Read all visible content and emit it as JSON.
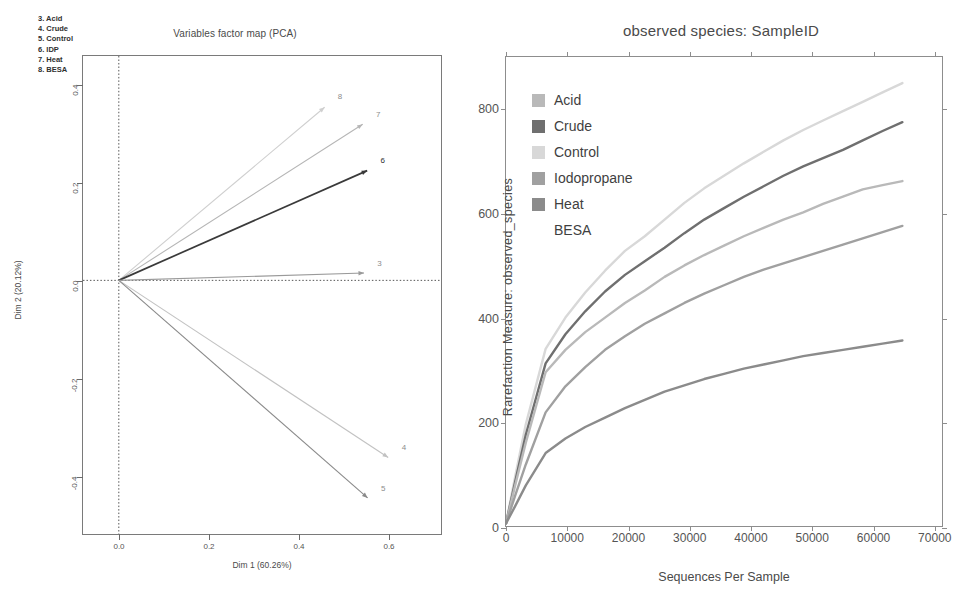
{
  "pca": {
    "title": "Variables factor map (PCA)",
    "xlabel": "Dim 1 (60.26%)",
    "ylabel": "Dim 2 (20.12%)",
    "legend_lines": [
      "3. Acid",
      "4. Crude",
      "5. Control",
      "6. IDP",
      "7. Heat",
      "8. BESA"
    ],
    "xticks": [
      "0.0",
      "0.2",
      "0.4",
      "0.6"
    ],
    "yticks": [
      "0.4",
      "0.2",
      "0.0",
      "-0.2",
      "-0.4"
    ]
  },
  "rarefaction": {
    "title": "observed species: SampleID",
    "xlabel": "Sequences Per Sample",
    "ylabel": "Rarefaction Measure: observed_species",
    "xticks": [
      "0",
      "10000",
      "20000",
      "30000",
      "40000",
      "50000",
      "60000",
      "70000"
    ],
    "yticks": [
      "0",
      "200",
      "400",
      "600",
      "800"
    ],
    "legend": [
      {
        "label": "Acid",
        "color": "#b9b9b9",
        "swatch": true
      },
      {
        "label": "Crude",
        "color": "#6f6f6f",
        "swatch": true
      },
      {
        "label": "Control",
        "color": "#d8d8d8",
        "swatch": true
      },
      {
        "label": "Iodopropane",
        "color": "#a0a0a0",
        "swatch": true
      },
      {
        "label": "Heat",
        "color": "#8b8b8b",
        "swatch": true
      },
      {
        "label": "BESA",
        "color": "#ffffff",
        "swatch": false
      }
    ]
  },
  "chart_data": [
    {
      "type": "scatter",
      "name": "pca-variables-factor-map",
      "title": "Variables factor map (PCA)",
      "xlabel": "Dim 1 (60.26%)",
      "ylabel": "Dim 2 (20.12%)",
      "xlim": [
        -0.08,
        0.72
      ],
      "ylim": [
        -0.52,
        0.46
      ],
      "grid": false,
      "legend": "inside-top-left",
      "annotations": [
        "3. Acid",
        "4. Crude",
        "5. Control",
        "6. IDP",
        "7. Heat",
        "8. BESA"
      ],
      "vectors": [
        {
          "id": "8",
          "name": "BESA",
          "x": 0.46,
          "y": 0.355,
          "color": "#cfcfcf"
        },
        {
          "id": "7",
          "name": "Heat",
          "x": 0.545,
          "y": 0.32,
          "color": "#b5b5b5"
        },
        {
          "id": "6",
          "name": "IDP",
          "x": 0.555,
          "y": 0.225,
          "color": "#3a3a3a"
        },
        {
          "id": "3",
          "name": "Acid",
          "x": 0.548,
          "y": 0.015,
          "color": "#9a9a9a"
        },
        {
          "id": "4",
          "name": "Crude",
          "x": 0.602,
          "y": -0.363,
          "color": "#c2c2c2"
        },
        {
          "id": "5",
          "name": "Control",
          "x": 0.556,
          "y": -0.446,
          "color": "#8a8a8a"
        }
      ]
    },
    {
      "type": "line",
      "name": "rarefaction-observed-species",
      "title": "observed species: SampleID",
      "xlabel": "Sequences Per Sample",
      "ylabel": "Rarefaction Measure: observed_species",
      "xlim": [
        0,
        71500
      ],
      "ylim": [
        0,
        900
      ],
      "grid": false,
      "legend": "inside-top-left",
      "x": [
        0,
        1500,
        3250,
        6500,
        9750,
        13000,
        16250,
        19500,
        22750,
        26000,
        29250,
        32500,
        35750,
        39000,
        42250,
        45500,
        48750,
        52000,
        55250,
        58500,
        61750,
        65000
      ],
      "series": [
        {
          "name": "Control",
          "color": "#d8d8d8",
          "values": [
            5,
            95,
            195,
            340,
            400,
            448,
            490,
            528,
            556,
            588,
            620,
            648,
            672,
            696,
            718,
            740,
            760,
            778,
            796,
            814,
            832,
            850
          ]
        },
        {
          "name": "Crude",
          "color": "#6f6f6f",
          "values": [
            5,
            85,
            175,
            312,
            368,
            412,
            450,
            482,
            508,
            534,
            562,
            588,
            610,
            632,
            652,
            672,
            690,
            706,
            722,
            740,
            758,
            775
          ]
        },
        {
          "name": "Acid",
          "color": "#b9b9b9",
          "values": [
            5,
            78,
            160,
            295,
            338,
            372,
            400,
            428,
            452,
            478,
            500,
            520,
            538,
            556,
            572,
            588,
            602,
            618,
            632,
            646,
            654,
            662
          ]
        },
        {
          "name": "Iodopropane",
          "color": "#a0a0a0",
          "values": [
            5,
            58,
            118,
            218,
            268,
            305,
            338,
            364,
            388,
            408,
            428,
            446,
            462,
            478,
            492,
            504,
            516,
            528,
            540,
            552,
            564,
            576
          ]
        },
        {
          "name": "Heat",
          "color": "#8b8b8b",
          "values": [
            5,
            38,
            78,
            140,
            168,
            190,
            208,
            226,
            242,
            258,
            270,
            282,
            292,
            302,
            310,
            318,
            326,
            332,
            338,
            344,
            350,
            356
          ]
        }
      ]
    }
  ]
}
